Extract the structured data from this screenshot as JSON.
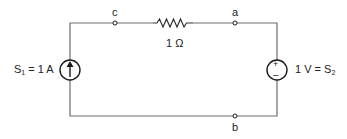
{
  "diagram": {
    "type": "circuit",
    "nodes": {
      "c": "c",
      "a": "a",
      "b": "b"
    },
    "resistor": {
      "label": "1 Ω",
      "value_ohms": 1,
      "between": [
        "c",
        "a"
      ]
    },
    "current_source": {
      "name": "S",
      "subscript": "1",
      "value_text": " = 1 A",
      "value_amps": 1,
      "direction": "up"
    },
    "voltage_source": {
      "prefix_text": "1 V = S",
      "subscript": "2",
      "value_volts": 1,
      "plus_sign": "+",
      "minus_sign": "−"
    }
  }
}
